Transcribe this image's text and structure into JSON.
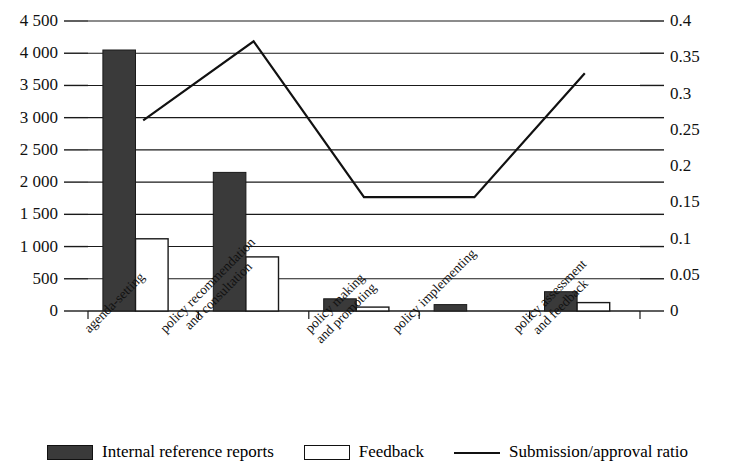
{
  "chart_data": {
    "type": "bar",
    "title": "",
    "xlabel": "",
    "ylabel": "",
    "grid": true,
    "legend_position": "bottom",
    "categories": [
      "agenda-setting",
      "policy recommendation and consultation",
      "policy making and promoting",
      "policy implementing",
      "policy assessment and feedback"
    ],
    "category_lines": [
      [
        "agenda-setting",
        ""
      ],
      [
        "policy recommendation",
        "and consultation"
      ],
      [
        "policy making",
        "and promoting"
      ],
      [
        "policy implementing",
        ""
      ],
      [
        "policy assessment",
        "and feedback"
      ]
    ],
    "axes": {
      "left": {
        "min": 0,
        "max": 4500,
        "step": 500,
        "ticks": [
          "0",
          "500",
          "1 000",
          "1 500",
          "2 000",
          "2 500",
          "3 000",
          "3 500",
          "4 000",
          "4 500"
        ]
      },
      "right": {
        "min": 0,
        "max": 0.4,
        "step": 0.05,
        "ticks": [
          "0",
          "0.05",
          "0.1",
          "0.15",
          "0.2",
          "0.25",
          "0.3",
          "0.35",
          "0.4"
        ]
      }
    },
    "series": [
      {
        "name": "Internal reference reports",
        "type": "bar",
        "axis": "left",
        "color": "#3a3a3a",
        "values": [
          4050,
          2150,
          190,
          100,
          300
        ]
      },
      {
        "name": "Feedback",
        "type": "bar",
        "axis": "left",
        "color": "#ffffff",
        "values": [
          1120,
          840,
          60,
          0,
          130
        ]
      },
      {
        "name": "Submission/approval ratio",
        "type": "line",
        "axis": "right",
        "color": "#111111",
        "values": [
          0.263,
          0.372,
          0.157,
          0.157,
          0.328
        ]
      }
    ]
  },
  "legend": {
    "items": [
      {
        "label": "Internal reference reports",
        "swatch": "dark-square-swatch"
      },
      {
        "label": "Feedback",
        "swatch": "white-square-swatch"
      },
      {
        "label": "Submission/approval ratio",
        "swatch": "line-swatch"
      }
    ]
  }
}
